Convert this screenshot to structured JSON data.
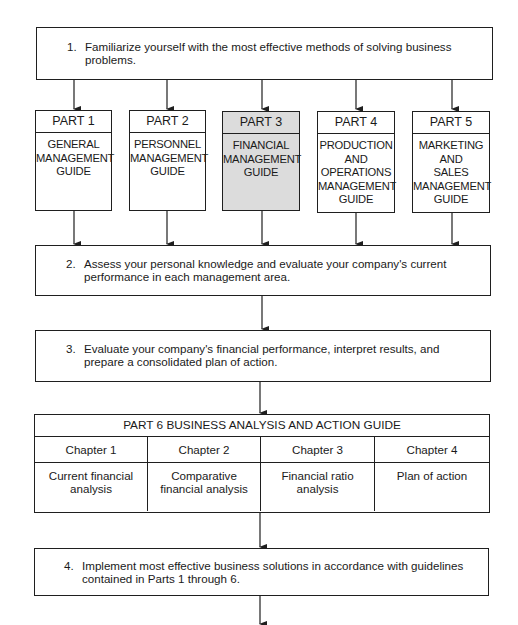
{
  "steps": [
    {
      "number": "1.",
      "text": "Familiarize yourself with the most effective methods of solving business problems."
    },
    {
      "number": "2.",
      "text": "Assess your personal knowledge and evaluate  your company's current performance in each management area."
    },
    {
      "number": "3.",
      "text": "Evaluate your company's financial performance, interpret results, and prepare a consolidated plan of action."
    },
    {
      "number": "4.",
      "text": "Implement most effective business solutions in accordance with guidelines contained in Parts 1 through 6."
    }
  ],
  "parts": [
    {
      "label": "PART 1",
      "lines": [
        "GENERAL",
        "MANAGEMENT",
        "GUIDE"
      ],
      "highlighted": false
    },
    {
      "label": "PART 2",
      "lines": [
        "PERSONNEL",
        "MANAGEMENT",
        "GUIDE"
      ],
      "highlighted": false
    },
    {
      "label": "PART 3",
      "lines": [
        "FINANCIAL",
        "MANAGEMENT",
        "GUIDE"
      ],
      "highlighted": true
    },
    {
      "label": "PART 4",
      "lines": [
        "PRODUCTION",
        "AND",
        "OPERATIONS",
        "MANAGEMENT",
        "GUIDE"
      ],
      "highlighted": false
    },
    {
      "label": "PART 5",
      "lines": [
        "MARKETING",
        "AND",
        "SALES",
        "MANAGEMENT",
        "GUIDE"
      ],
      "highlighted": false
    }
  ],
  "part6": {
    "title": "PART 6  BUSINESS ANALYSIS AND ACTION GUIDE",
    "chapters": [
      {
        "label": "Chapter 1",
        "lines": [
          "Current financial",
          "analysis"
        ]
      },
      {
        "label": "Chapter 2",
        "lines": [
          "Comparative",
          "financial analysis"
        ]
      },
      {
        "label": "Chapter 3",
        "lines": [
          "Financial ratio",
          "analysis"
        ]
      },
      {
        "label": "Chapter 4",
        "lines": [
          "Plan of action"
        ]
      }
    ]
  },
  "colors": {
    "line": "#1f1f1f",
    "highlight_fill": "#dcdcdc",
    "background": "#ffffff"
  }
}
